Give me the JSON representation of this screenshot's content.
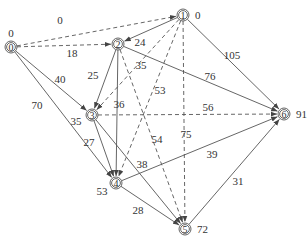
{
  "diagram": {
    "type": "activity-network",
    "nodes": [
      {
        "id": "0",
        "value": "0",
        "x": 11,
        "y": 47,
        "val_dx": 0,
        "val_dy": -10
      },
      {
        "id": "1",
        "value": "0",
        "x": 183,
        "y": 15,
        "val_dx": 12,
        "val_dy": 4
      },
      {
        "id": "2",
        "value": "",
        "x": 118,
        "y": 44,
        "val_dx": 0,
        "val_dy": 0
      },
      {
        "id": "3",
        "value": "35",
        "x": 92,
        "y": 115,
        "val_dx": -16,
        "val_dy": 10
      },
      {
        "id": "4",
        "value": "53",
        "x": 116,
        "y": 183,
        "val_dx": -14,
        "val_dy": 12
      },
      {
        "id": "5",
        "value": "72",
        "x": 185,
        "y": 229,
        "val_dx": 12,
        "val_dy": 4
      },
      {
        "id": "6",
        "value": "91",
        "x": 284,
        "y": 114,
        "val_dx": 12,
        "val_dy": 4
      }
    ],
    "edges": [
      {
        "from": "0",
        "to": "1",
        "weight": "0",
        "style": "dashed",
        "lx": 60,
        "ly": 24
      },
      {
        "from": "0",
        "to": "2",
        "weight": "18",
        "style": "dashed",
        "lx": 72,
        "ly": 57
      },
      {
        "from": "0",
        "to": "3",
        "weight": "40",
        "style": "solid",
        "lx": 60,
        "ly": 83
      },
      {
        "from": "0",
        "to": "4",
        "weight": "70",
        "style": "solid",
        "lx": 37,
        "ly": 109
      },
      {
        "from": "1",
        "to": "2",
        "weight": "24",
        "style": "solid",
        "lx": 140,
        "ly": 46
      },
      {
        "from": "1",
        "to": "3",
        "weight": "35",
        "style": "dashed",
        "lx": 141,
        "ly": 69
      },
      {
        "from": "1",
        "to": "4",
        "weight": "53",
        "style": "dashed",
        "lx": 160,
        "ly": 94
      },
      {
        "from": "1",
        "to": "5",
        "weight": "75",
        "style": "dashed",
        "lx": 186,
        "ly": 138
      },
      {
        "from": "1",
        "to": "6",
        "weight": "105",
        "style": "solid",
        "lx": 232,
        "ly": 59
      },
      {
        "from": "2",
        "to": "3",
        "weight": "25",
        "style": "solid",
        "lx": 93,
        "ly": 79
      },
      {
        "from": "2",
        "to": "4",
        "weight": "36",
        "style": "solid",
        "lx": 119,
        "ly": 108
      },
      {
        "from": "2",
        "to": "5",
        "weight": "54",
        "style": "dashed",
        "lx": 157,
        "ly": 143
      },
      {
        "from": "2",
        "to": "6",
        "weight": "76",
        "style": "solid",
        "lx": 210,
        "ly": 80
      },
      {
        "from": "3",
        "to": "4",
        "weight": "27",
        "style": "solid",
        "lx": 89,
        "ly": 146
      },
      {
        "from": "3",
        "to": "5",
        "weight": "38",
        "style": "solid",
        "lx": 142,
        "ly": 168
      },
      {
        "from": "3",
        "to": "6",
        "weight": "56",
        "style": "dashed",
        "lx": 208,
        "ly": 111
      },
      {
        "from": "4",
        "to": "5",
        "weight": "28",
        "style": "solid",
        "lx": 138,
        "ly": 214
      },
      {
        "from": "4",
        "to": "6",
        "weight": "39",
        "style": "solid",
        "lx": 212,
        "ly": 158
      },
      {
        "from": "5",
        "to": "6",
        "weight": "31",
        "style": "solid",
        "lx": 238,
        "ly": 185
      }
    ]
  }
}
